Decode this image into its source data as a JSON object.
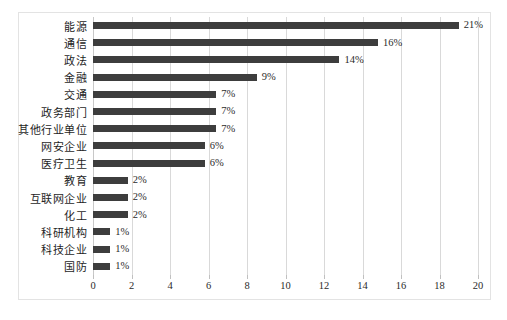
{
  "chart_data": {
    "type": "bar",
    "orientation": "horizontal",
    "title": "",
    "subtitle": "",
    "xlabel": "",
    "ylabel": "",
    "xlim": [
      0,
      20
    ],
    "xticks": [
      0,
      2,
      4,
      6,
      8,
      10,
      12,
      14,
      16,
      18,
      20
    ],
    "grid": true,
    "legend": false,
    "bar_color": "#3d3d3d",
    "gridline_color": "#d9d9d9",
    "categories": [
      "能源",
      "通信",
      "政法",
      "金融",
      "交通",
      "政务部门",
      "其他行业单位",
      "网安企业",
      "医疗卫生",
      "教育",
      "互联网企业",
      "化工",
      "科研机构",
      "科技企业",
      "国防"
    ],
    "values": [
      19.0,
      14.8,
      12.8,
      8.5,
      6.4,
      6.4,
      6.4,
      5.8,
      5.8,
      1.8,
      1.8,
      1.8,
      0.9,
      0.9,
      0.9
    ],
    "data_labels": [
      "21%",
      "16%",
      "14%",
      "9%",
      "7%",
      "7%",
      "7%",
      "6%",
      "6%",
      "2%",
      "2%",
      "2%",
      "1%",
      "1%",
      "1%"
    ]
  }
}
